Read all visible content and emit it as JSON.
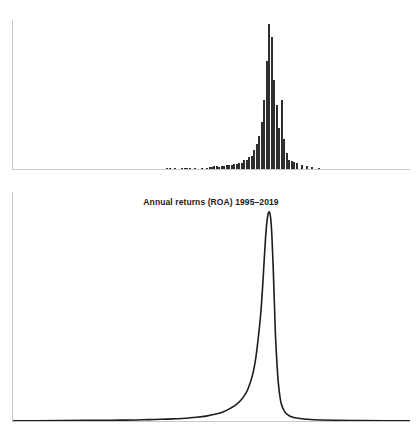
{
  "figure": {
    "background_color": "#ffffff",
    "mark_color": "#2e2e2e",
    "axis_color": "#c9c9c9"
  },
  "density_panel": {
    "title": "Annual returns (ROA) 1995–2019"
  },
  "chart_data": [
    {
      "type": "bar",
      "name": "histogram-annual-returns-roa",
      "title": "",
      "xlabel": "",
      "ylabel": "",
      "grid": false,
      "legend": null,
      "xlim": [
        -1.0,
        0.6
      ],
      "ylim": [
        0,
        1500
      ],
      "bin_width": 0.01,
      "categories": [
        "-0.38",
        "-0.37",
        "-0.35",
        "-0.32",
        "-0.31",
        "-0.30",
        "-0.29",
        "-0.27",
        "-0.24",
        "-0.22",
        "-0.21",
        "-0.20",
        "-0.19",
        "-0.18",
        "-0.17",
        "-0.16",
        "-0.15",
        "-0.14",
        "-0.13",
        "-0.12",
        "-0.11",
        "-0.10",
        "-0.09",
        "-0.08",
        "-0.07",
        "-0.06",
        "-0.05",
        "-0.04",
        "-0.03",
        "-0.02",
        "-0.01",
        "0.00",
        "0.01",
        "0.02",
        "0.03",
        "0.04",
        "0.05",
        "0.06",
        "0.07",
        "0.08",
        "0.09",
        "0.10",
        "0.11",
        "0.12",
        "0.13",
        "0.14",
        "0.16",
        "0.18",
        "0.20",
        "0.23"
      ],
      "values": [
        6,
        6,
        10,
        10,
        12,
        9,
        9,
        6,
        7,
        14,
        20,
        25,
        28,
        26,
        24,
        31,
        27,
        37,
        40,
        36,
        55,
        52,
        63,
        60,
        92,
        90,
        125,
        135,
        190,
        250,
        330,
        470,
        690,
        1090,
        1460,
        1330,
        900,
        640,
        410,
        690,
        300,
        160,
        95,
        80,
        70,
        60,
        40,
        28,
        18,
        10
      ]
    },
    {
      "type": "line",
      "name": "density-annual-returns-roa",
      "title": "Annual returns (ROA) 1995–2019",
      "xlabel": "",
      "ylabel": "",
      "grid": false,
      "legend": null,
      "xlim": [
        -1.0,
        0.6
      ],
      "ylim": [
        0,
        14
      ],
      "peak_x": 0.035,
      "peak_y": 13.6,
      "x": [
        -1.0,
        -0.9,
        -0.8,
        -0.7,
        -0.6,
        -0.55,
        -0.5,
        -0.45,
        -0.4,
        -0.35,
        -0.3,
        -0.26,
        -0.22,
        -0.18,
        -0.15,
        -0.12,
        -0.1,
        -0.08,
        -0.06,
        -0.05,
        -0.04,
        -0.03,
        -0.02,
        -0.01,
        0.0,
        0.005,
        0.01,
        0.015,
        0.02,
        0.025,
        0.03,
        0.035,
        0.04,
        0.045,
        0.05,
        0.055,
        0.06,
        0.07,
        0.08,
        0.09,
        0.1,
        0.12,
        0.15,
        0.2,
        0.3,
        0.4,
        0.5,
        0.6
      ],
      "y": [
        0.02,
        0.02,
        0.03,
        0.04,
        0.05,
        0.06,
        0.07,
        0.09,
        0.11,
        0.14,
        0.18,
        0.24,
        0.32,
        0.45,
        0.6,
        0.85,
        1.05,
        1.35,
        1.8,
        2.15,
        2.6,
        3.2,
        4.1,
        5.4,
        7.0,
        8.1,
        9.4,
        10.8,
        12.1,
        13.0,
        13.5,
        13.6,
        13.2,
        12.0,
        10.0,
        7.6,
        5.3,
        2.6,
        1.3,
        0.8,
        0.52,
        0.3,
        0.18,
        0.1,
        0.05,
        0.03,
        0.02,
        0.02
      ]
    }
  ]
}
